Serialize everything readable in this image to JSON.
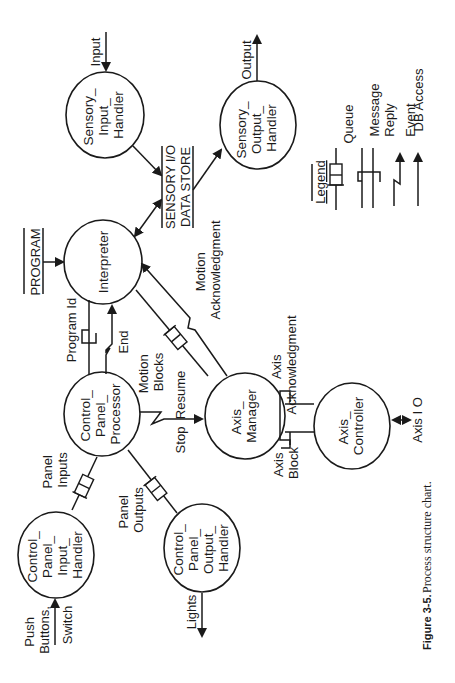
{
  "figure": {
    "caption_label": "Figure 3-5.",
    "caption_text": "Process structure chart.",
    "orientation": "rotated 90deg counter-clockwise"
  },
  "nodes": {
    "sensory_input_handler": [
      "Sensory_",
      "Input_",
      "Handler"
    ],
    "sensory_output_handler": [
      "Sensory_",
      "Output_",
      "Handler"
    ],
    "interpreter": [
      "Interpreter"
    ],
    "control_panel_processor": [
      "Control_",
      "Panel_",
      "Processor"
    ],
    "axis_manager": [
      "Axis_",
      "Manager"
    ],
    "axis_controller": [
      "Axis_",
      "Controller"
    ],
    "control_panel_input_handler": [
      "Control_",
      "Panel_",
      "Input_",
      "Handler"
    ],
    "control_panel_output_handler": [
      "Control_",
      "Panel_",
      "Output_",
      "Handler"
    ]
  },
  "data_stores": {
    "sensory_io": [
      "SENSORY I/O",
      "DATA STORE"
    ],
    "program": [
      "PROGRAM"
    ]
  },
  "flows": {
    "input": "Input",
    "output": "Output",
    "program_id": "Program Id",
    "end": "End",
    "motion_blocks": [
      "Motion",
      "Blocks"
    ],
    "motion_ack": [
      "Motion",
      "Acknowledgment"
    ],
    "stop": "Stop",
    "resume": "Resume",
    "axis_ack": [
      "Axis",
      "Acknowledgment"
    ],
    "axis_block": [
      "Axis",
      "Block"
    ],
    "axis_io": "Axis I O",
    "panel_inputs": [
      "Panel",
      "Inputs"
    ],
    "panel_outputs": [
      "Panel",
      "Outputs"
    ],
    "push_buttons": [
      "Push",
      "Buttons,"
    ],
    "switch": "Switch",
    "lights": "Lights"
  },
  "legend": {
    "title": "Legend",
    "items": [
      {
        "label": "Queue",
        "icon": "queue-icon"
      },
      {
        "label": "Message",
        "icon": "message-icon"
      },
      {
        "label": "Reply",
        "icon": "reply-icon"
      },
      {
        "label": "Event",
        "icon": "event-icon"
      },
      {
        "label": "DB Access",
        "icon": "db-access-icon"
      }
    ]
  },
  "colors": {
    "ink": "#1a1a1a",
    "background": "#ffffff"
  }
}
